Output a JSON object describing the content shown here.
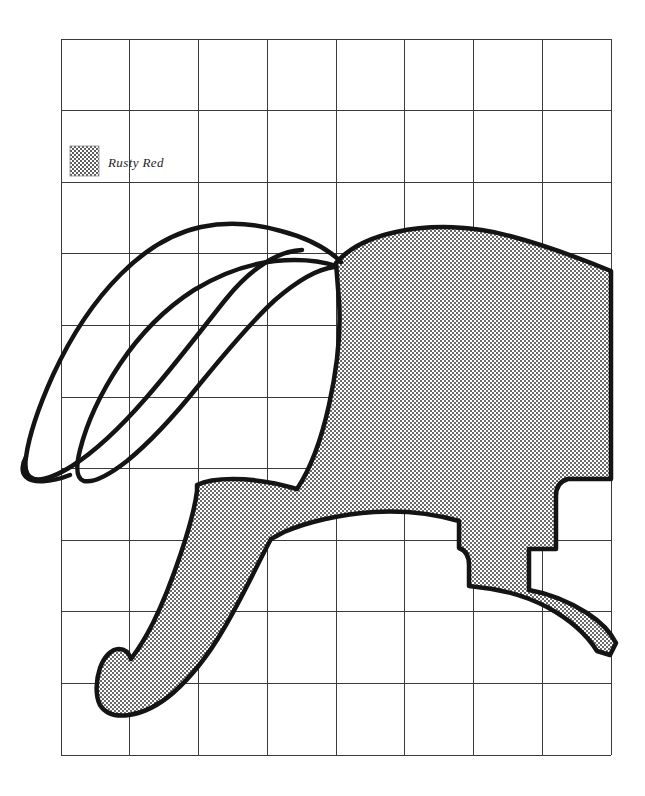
{
  "page": {
    "background_color": "#ffffff",
    "width": 645,
    "height": 796
  },
  "grid": {
    "line_color": "#3a3a3a",
    "line_width": 1,
    "left": 61,
    "top": 39,
    "right": 611,
    "bottom": 755,
    "columns": 8,
    "rows": 10,
    "cell_width": 68.75,
    "cell_height": 71.6,
    "x_lines": [
      61,
      129.75,
      198.5,
      267.25,
      336,
      404.75,
      473.5,
      542.25,
      611
    ],
    "y_lines": [
      39,
      110.6,
      182.2,
      253.8,
      325.4,
      397,
      468.6,
      540.2,
      611.8,
      683.4,
      755
    ]
  },
  "legend": {
    "swatch": {
      "name": "rusty-red-swatch",
      "x": 70,
      "y": 146,
      "width": 29,
      "height": 30,
      "fill_pattern": "checker-stipple",
      "pattern_color": "#555555",
      "border_color": "#8a8a8a"
    },
    "entries": [
      {
        "label": "Rusty Red",
        "text_x": 108,
        "text_y": 166
      }
    ]
  },
  "artwork": {
    "outline_color": "#141414",
    "outline_width": 4,
    "fill_pattern_color": "#5a5a5a",
    "fill_pattern_background": "#ffffff",
    "subject": "hare",
    "shapes": [
      {
        "name": "hare-body-shaded",
        "shaded": true,
        "color_key": "Rusty Red",
        "path": "M 336 265 C 352 250 374 239 404 234 C 444 228 486 230 522 241 C 556 251 588 262 611 272 L 611 479 L 566 479 C 560 481 556 486 556 493 L 556 548 L 530 548 L 530 590 C 545 592 566 598 585 610 C 600 620 610 632 615 642 L 611 652 L 598 650 C 588 634 570 618 548 606 C 525 594 500 588 478 586 L 470 586 L 470 564 C 470 556 466 550 460 548 L 460 522 C 440 516 410 510 375 512 C 340 514 305 522 282 532 L 270 538 C 258 560 240 600 222 630 C 208 654 190 676 172 692 C 158 704 142 712 128 714 C 114 716 104 712 99 704 C 94 694 95 680 99 668 C 103 656 110 648 118 648 C 124 648 128 652 130 658 C 136 650 144 638 152 622 C 162 602 172 576 180 552 C 188 528 194 506 196 490 L 196 484 C 204 480 216 478 232 478 C 252 478 276 482 296 488 C 308 470 320 440 328 404 C 336 368 340 330 338 300 Z"
      },
      {
        "name": "hare-near-ear-outline",
        "shaded": false,
        "path": "M 336 262 C 320 250 300 240 278 232 C 250 222 222 219 198 223 C 170 228 142 244 118 268 C 92 294 68 330 50 370 C 36 402 26 434 23 456 C 21 470 24 478 31 480 C 40 482 54 478 70 468 C 92 454 118 430 144 400 C 172 368 200 330 224 300 C 250 268 276 250 300 250"
      },
      {
        "name": "hare-far-ear-outline",
        "shaded": false,
        "path": "M 334 268 C 318 262 298 260 276 262 C 250 264 222 274 196 290 C 168 308 142 334 122 364 C 102 394 88 426 82 450 C 77 470 78 480 85 482 C 94 484 110 476 128 462 C 150 444 176 416 200 386 C 226 354 252 322 276 300 C 298 280 318 270 334 268"
      }
    ]
  }
}
